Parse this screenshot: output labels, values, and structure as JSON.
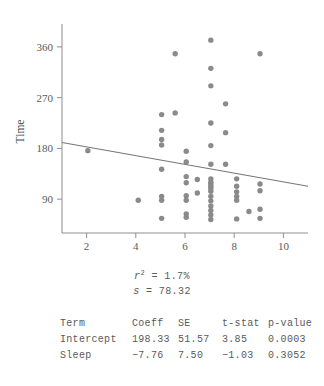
{
  "chart_data": {
    "type": "scatter",
    "title": "",
    "xlabel": "Sleep",
    "ylabel": "Time",
    "xlim": [
      1,
      11
    ],
    "ylim": [
      30,
      390
    ],
    "xticks": [
      2,
      4,
      6,
      8,
      10
    ],
    "yticks": [
      90,
      180,
      270,
      360
    ],
    "grid": false,
    "legend": null,
    "marker_color": "#8a8a8a",
    "line_color": "#77777a",
    "points": [
      {
        "x": 2.05,
        "y": 176
      },
      {
        "x": 4.1,
        "y": 88
      },
      {
        "x": 5.05,
        "y": 240
      },
      {
        "x": 5.05,
        "y": 212
      },
      {
        "x": 5.05,
        "y": 196
      },
      {
        "x": 5.05,
        "y": 186
      },
      {
        "x": 5.05,
        "y": 143
      },
      {
        "x": 5.05,
        "y": 95
      },
      {
        "x": 5.05,
        "y": 88
      },
      {
        "x": 5.05,
        "y": 56
      },
      {
        "x": 5.6,
        "y": 348
      },
      {
        "x": 5.6,
        "y": 243
      },
      {
        "x": 6.05,
        "y": 175
      },
      {
        "x": 6.05,
        "y": 156
      },
      {
        "x": 6.05,
        "y": 130
      },
      {
        "x": 6.05,
        "y": 119
      },
      {
        "x": 6.05,
        "y": 96
      },
      {
        "x": 6.05,
        "y": 88
      },
      {
        "x": 6.05,
        "y": 64
      },
      {
        "x": 6.05,
        "y": 58
      },
      {
        "x": 6.5,
        "y": 125
      },
      {
        "x": 6.5,
        "y": 101
      },
      {
        "x": 7.05,
        "y": 372
      },
      {
        "x": 7.05,
        "y": 322
      },
      {
        "x": 7.05,
        "y": 291
      },
      {
        "x": 7.05,
        "y": 225
      },
      {
        "x": 7.05,
        "y": 185
      },
      {
        "x": 7.05,
        "y": 152
      },
      {
        "x": 7.05,
        "y": 126
      },
      {
        "x": 7.05,
        "y": 120
      },
      {
        "x": 7.05,
        "y": 117
      },
      {
        "x": 7.05,
        "y": 113
      },
      {
        "x": 7.05,
        "y": 109
      },
      {
        "x": 7.05,
        "y": 104
      },
      {
        "x": 7.05,
        "y": 95
      },
      {
        "x": 7.05,
        "y": 87
      },
      {
        "x": 7.05,
        "y": 78
      },
      {
        "x": 7.05,
        "y": 70
      },
      {
        "x": 7.05,
        "y": 62
      },
      {
        "x": 7.05,
        "y": 54
      },
      {
        "x": 7.65,
        "y": 259
      },
      {
        "x": 7.65,
        "y": 208
      },
      {
        "x": 7.65,
        "y": 152
      },
      {
        "x": 8.1,
        "y": 126
      },
      {
        "x": 8.1,
        "y": 113
      },
      {
        "x": 8.1,
        "y": 103
      },
      {
        "x": 8.1,
        "y": 95
      },
      {
        "x": 8.1,
        "y": 88
      },
      {
        "x": 8.1,
        "y": 55
      },
      {
        "x": 8.6,
        "y": 68
      },
      {
        "x": 9.05,
        "y": 348
      },
      {
        "x": 9.05,
        "y": 117
      },
      {
        "x": 9.05,
        "y": 105
      },
      {
        "x": 9.05,
        "y": 72
      },
      {
        "x": 9.05,
        "y": 56
      }
    ],
    "regression": {
      "intercept": 198.33,
      "slope": -7.76,
      "x_start": 1,
      "x_end": 11
    }
  },
  "stats": {
    "r_squared_label": "r",
    "r_squared_exponent": "2",
    "r_squared_eq": " = 1.7%",
    "s_label": "s",
    "s_eq": " = 78.32"
  },
  "table": {
    "headers": [
      "Term",
      "Coeff",
      "SE",
      "t-stat",
      "p-value"
    ],
    "rows": [
      {
        "term": "Intercept",
        "coeff": "198.33",
        "se": "51.57",
        "tstat": "3.85",
        "pvalue": "0.0003"
      },
      {
        "term": "Sleep",
        "coeff": "−7.76",
        "se": "7.50",
        "tstat": "−1.03",
        "pvalue": "0.3052"
      }
    ]
  },
  "axes": {
    "x_title": "Sleep",
    "y_title": "Time",
    "x_ticks": [
      "2",
      "4",
      "6",
      "8",
      "10"
    ],
    "y_ticks": [
      "90",
      "180",
      "270",
      "360"
    ]
  }
}
